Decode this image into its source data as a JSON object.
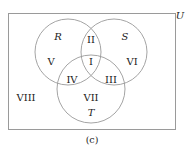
{
  "diagram": {
    "type": "venn",
    "universe_label": "U",
    "caption": "(c)",
    "sets": [
      {
        "name": "R",
        "cx": 68,
        "cy": 52,
        "r": 33
      },
      {
        "name": "S",
        "cx": 114,
        "cy": 52,
        "r": 33
      },
      {
        "name": "T",
        "cx": 91,
        "cy": 89,
        "r": 34
      }
    ],
    "regions": [
      {
        "label": "I",
        "x": 91,
        "y": 62
      },
      {
        "label": "II",
        "x": 91,
        "y": 40
      },
      {
        "label": "III",
        "x": 111,
        "y": 80
      },
      {
        "label": "IV",
        "x": 72,
        "y": 80
      },
      {
        "label": "V",
        "x": 51,
        "y": 62
      },
      {
        "label": "VI",
        "x": 132,
        "y": 62
      },
      {
        "label": "VII",
        "x": 91,
        "y": 98
      },
      {
        "label": "VIII",
        "x": 26,
        "y": 98
      }
    ],
    "colors": {
      "stroke": "#9a9a9a",
      "text": "#222222"
    }
  }
}
